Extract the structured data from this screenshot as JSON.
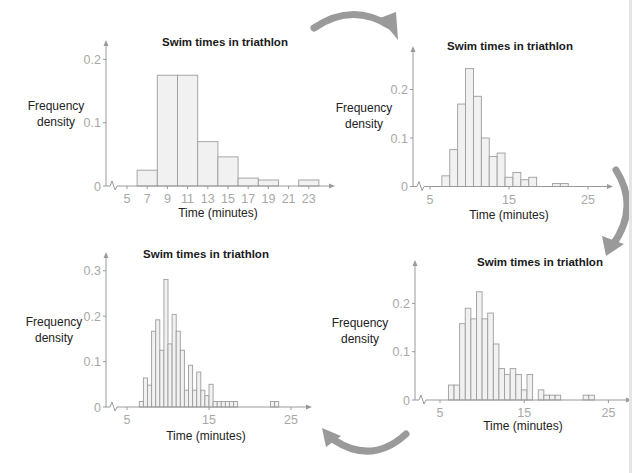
{
  "arrows": {
    "color": "#9a9a9a",
    "direction": "clockwise",
    "count": 4
  },
  "chart_data": [
    {
      "id": "top-left",
      "type": "bar",
      "subtype": "histogram",
      "title": "Swim times in triathlon",
      "xlabel": "Time (minutes)",
      "ylabel": [
        "Frequency",
        "density"
      ],
      "x_ticks": [
        5,
        7,
        9,
        11,
        13,
        15,
        17,
        19,
        21,
        23
      ],
      "y_ticks": [
        0,
        0.1,
        0.2
      ],
      "y_tick_labels": [
        "0",
        "0.1",
        "0.2"
      ],
      "xlim": [
        4.2,
        25.2
      ],
      "ylim": [
        0,
        0.23
      ],
      "axis_break": true,
      "bin_width": 2,
      "bins": [
        {
          "start": 6,
          "end": 8,
          "value": 0.025
        },
        {
          "start": 8,
          "end": 10,
          "value": 0.175
        },
        {
          "start": 10,
          "end": 12,
          "value": 0.175
        },
        {
          "start": 12,
          "end": 14,
          "value": 0.07
        },
        {
          "start": 14,
          "end": 16,
          "value": 0.046
        },
        {
          "start": 16,
          "end": 18,
          "value": 0.0125
        },
        {
          "start": 18,
          "end": 20,
          "value": 0.0095
        },
        {
          "start": 20,
          "end": 22,
          "value": 0
        },
        {
          "start": 22,
          "end": 24,
          "value": 0.0095
        }
      ]
    },
    {
      "id": "top-right",
      "type": "bar",
      "subtype": "histogram",
      "title": "Swim times in triathlon",
      "xlabel": "Time (minutes)",
      "ylabel": [
        "Frequency",
        "density"
      ],
      "x_ticks": [
        5,
        15,
        25
      ],
      "y_ticks": [
        0,
        0.1,
        0.2
      ],
      "y_tick_labels": [
        "0",
        "0.1",
        "0.2"
      ],
      "xlim": [
        4.0,
        27.5
      ],
      "ylim": [
        0,
        0.27
      ],
      "axis_break": true,
      "bin_width": 1,
      "bins": [
        {
          "start": 6.5,
          "end": 7.5,
          "value": 0.022
        },
        {
          "start": 7.5,
          "end": 8.5,
          "value": 0.076
        },
        {
          "start": 8.5,
          "end": 9.5,
          "value": 0.17
        },
        {
          "start": 9.5,
          "end": 10.5,
          "value": 0.243
        },
        {
          "start": 10.5,
          "end": 11.5,
          "value": 0.186
        },
        {
          "start": 11.5,
          "end": 12.5,
          "value": 0.1
        },
        {
          "start": 12.5,
          "end": 13.5,
          "value": 0.062
        },
        {
          "start": 13.5,
          "end": 14.5,
          "value": 0.069
        },
        {
          "start": 14.5,
          "end": 15.5,
          "value": 0.019
        },
        {
          "start": 15.5,
          "end": 16.5,
          "value": 0.029
        },
        {
          "start": 16.5,
          "end": 17.5,
          "value": 0.014
        },
        {
          "start": 17.5,
          "end": 18.5,
          "value": 0.019
        },
        {
          "start": 20.5,
          "end": 21.5,
          "value": 0.006
        },
        {
          "start": 21.5,
          "end": 22.5,
          "value": 0.006
        }
      ]
    },
    {
      "id": "bottom-right",
      "type": "bar",
      "subtype": "histogram",
      "title": "Swim times in triathlon",
      "xlabel": "Time (minutes)",
      "ylabel": [
        "Frequency",
        "density"
      ],
      "x_ticks": [
        5,
        15,
        25
      ],
      "y_ticks": [
        0,
        0.1,
        0.2
      ],
      "y_tick_labels": [
        "0",
        "0.1",
        "0.2"
      ],
      "xlim": [
        4.0,
        27.5
      ],
      "ylim": [
        0,
        0.25
      ],
      "axis_break": true,
      "bin_width": 0.667,
      "bins": [
        {
          "start": 6.0,
          "end": 6.667,
          "value": 0.031
        },
        {
          "start": 6.667,
          "end": 7.333,
          "value": 0.031
        },
        {
          "start": 7.333,
          "end": 8.0,
          "value": 0.158
        },
        {
          "start": 8.0,
          "end": 8.667,
          "value": 0.19
        },
        {
          "start": 8.667,
          "end": 9.333,
          "value": 0.168
        },
        {
          "start": 9.333,
          "end": 10.0,
          "value": 0.224
        },
        {
          "start": 10.0,
          "end": 10.667,
          "value": 0.168
        },
        {
          "start": 10.667,
          "end": 11.333,
          "value": 0.18
        },
        {
          "start": 11.333,
          "end": 12.0,
          "value": 0.116
        },
        {
          "start": 12.0,
          "end": 12.667,
          "value": 0.065
        },
        {
          "start": 12.667,
          "end": 13.333,
          "value": 0.053
        },
        {
          "start": 13.333,
          "end": 14.0,
          "value": 0.065
        },
        {
          "start": 14.0,
          "end": 14.667,
          "value": 0.053
        },
        {
          "start": 14.667,
          "end": 15.333,
          "value": 0.021
        },
        {
          "start": 15.333,
          "end": 16.0,
          "value": 0.053
        },
        {
          "start": 16.667,
          "end": 17.333,
          "value": 0.021
        },
        {
          "start": 17.333,
          "end": 18.0,
          "value": 0.01
        },
        {
          "start": 18.0,
          "end": 18.667,
          "value": 0.01
        },
        {
          "start": 18.667,
          "end": 19.333,
          "value": 0.01
        },
        {
          "start": 22.0,
          "end": 22.667,
          "value": 0.01
        },
        {
          "start": 22.667,
          "end": 23.333,
          "value": 0.01
        }
      ]
    },
    {
      "id": "bottom-left",
      "type": "bar",
      "subtype": "histogram",
      "title": "Swim times in triathlon",
      "xlabel": "Time (minutes)",
      "ylabel": [
        "Frequency",
        "density"
      ],
      "x_ticks": [
        5,
        15,
        25
      ],
      "y_ticks": [
        0,
        0.1,
        0.2,
        0.3
      ],
      "y_tick_labels": [
        "0",
        "0.1",
        "0.2",
        "0.3"
      ],
      "xlim": [
        4.0,
        27.3
      ],
      "ylim": [
        0,
        0.32
      ],
      "axis_break": true,
      "bin_width": 0.5,
      "bins": [
        {
          "start": 6.5,
          "end": 7.0,
          "value": 0.012
        },
        {
          "start": 7.0,
          "end": 7.5,
          "value": 0.064
        },
        {
          "start": 7.5,
          "end": 8.0,
          "value": 0.048
        },
        {
          "start": 8.0,
          "end": 8.5,
          "value": 0.167
        },
        {
          "start": 8.5,
          "end": 9.0,
          "value": 0.192
        },
        {
          "start": 9.0,
          "end": 9.5,
          "value": 0.125
        },
        {
          "start": 9.5,
          "end": 10.0,
          "value": 0.281
        },
        {
          "start": 10.0,
          "end": 10.5,
          "value": 0.139
        },
        {
          "start": 10.5,
          "end": 11.0,
          "value": 0.204
        },
        {
          "start": 11.0,
          "end": 11.5,
          "value": 0.167
        },
        {
          "start": 11.5,
          "end": 12.0,
          "value": 0.125
        },
        {
          "start": 12.0,
          "end": 12.5,
          "value": 0.037
        },
        {
          "start": 12.5,
          "end": 13.0,
          "value": 0.092
        },
        {
          "start": 13.0,
          "end": 13.5,
          "value": 0.037
        },
        {
          "start": 13.5,
          "end": 14.0,
          "value": 0.077
        },
        {
          "start": 14.0,
          "end": 14.5,
          "value": 0.037
        },
        {
          "start": 14.5,
          "end": 15.0,
          "value": 0.025
        },
        {
          "start": 15.0,
          "end": 15.5,
          "value": 0.05
        },
        {
          "start": 15.5,
          "end": 16.0,
          "value": 0.012
        },
        {
          "start": 16.0,
          "end": 16.5,
          "value": 0.012
        },
        {
          "start": 16.5,
          "end": 17.0,
          "value": 0.012
        },
        {
          "start": 17.0,
          "end": 17.5,
          "value": 0.012
        },
        {
          "start": 17.5,
          "end": 18.0,
          "value": 0.012
        },
        {
          "start": 18.0,
          "end": 18.5,
          "value": 0.012
        },
        {
          "start": 22.5,
          "end": 23.0,
          "value": 0.012
        },
        {
          "start": 23.0,
          "end": 23.5,
          "value": 0.012
        }
      ]
    }
  ],
  "layout": [
    {
      "chart": 0,
      "origin_x": 106,
      "origin_y": 186,
      "px_per_unit_x": 10.1,
      "px_per_unit_y": 633,
      "x0_value": 5,
      "x0_px": 127,
      "title_x": 225,
      "title_y": 46,
      "ylabel_x": 56,
      "ylabel_y": 110,
      "xlabel_x": 218,
      "xlabel_y": 217,
      "axis_top": 40,
      "axis_right": 335
    },
    {
      "chart": 1,
      "origin_x": 413,
      "origin_y": 186.5,
      "px_per_unit_x": 7.9,
      "px_per_unit_y": 485,
      "x0_value": 5,
      "x0_px": 430,
      "title_x": 510,
      "title_y": 50,
      "ylabel_x": 364,
      "ylabel_y": 112,
      "xlabel_x": 509,
      "xlabel_y": 219,
      "axis_top": 46,
      "axis_right": 613
    },
    {
      "chart": 2,
      "origin_x": 415,
      "origin_y": 400,
      "px_per_unit_x": 8.42,
      "px_per_unit_y": 483,
      "x0_value": 5,
      "x0_px": 440,
      "title_x": 540,
      "title_y": 266,
      "ylabel_x": 360,
      "ylabel_y": 327,
      "xlabel_x": 523,
      "xlabel_y": 430,
      "axis_top": 260,
      "axis_right": 632
    },
    {
      "chart": 3,
      "origin_x": 106,
      "origin_y": 407,
      "px_per_unit_x": 8.2,
      "px_per_unit_y": 454,
      "x0_value": 5,
      "x0_px": 127,
      "title_x": 206,
      "title_y": 258,
      "ylabel_x": 54,
      "ylabel_y": 326,
      "xlabel_x": 206,
      "xlabel_y": 440,
      "axis_top": 252,
      "axis_right": 312
    }
  ]
}
